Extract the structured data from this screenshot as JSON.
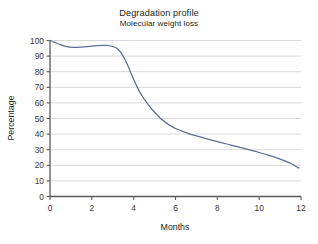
{
  "chart_data": {
    "type": "line",
    "title": "Degradation profile",
    "subtitle": "Molecular weight loss",
    "xlabel": "Months",
    "ylabel": "Percentage",
    "xlim": [
      0,
      12
    ],
    "ylim": [
      0,
      100
    ],
    "xticks": [
      0,
      2,
      4,
      6,
      8,
      10,
      12
    ],
    "yticks": [
      0,
      10,
      20,
      30,
      40,
      50,
      60,
      70,
      80,
      90,
      100
    ],
    "grid": "horizontal",
    "legend": "none",
    "line_color": "#5c6c94",
    "grid_color": "#d9d9d9",
    "axis_color": "#58595b",
    "series": [
      {
        "name": "Molecular weight loss",
        "x": [
          0,
          0.25,
          0.5,
          0.75,
          1.0,
          1.25,
          1.5,
          1.75,
          2.0,
          2.25,
          2.5,
          2.75,
          3.0,
          3.25,
          3.5,
          3.75,
          4.0,
          4.25,
          4.5,
          4.75,
          5.0,
          5.25,
          5.5,
          5.75,
          6.0,
          6.5,
          7.0,
          7.5,
          8.0,
          8.5,
          9.0,
          9.5,
          10.0,
          10.5,
          11.0,
          11.5,
          11.9
        ],
        "y": [
          100,
          98.6,
          97.3,
          96.3,
          95.8,
          95.6,
          95.7,
          96.0,
          96.4,
          96.7,
          96.9,
          96.8,
          96.2,
          94.4,
          90.0,
          83.0,
          75.0,
          68.0,
          62.5,
          58.0,
          54.0,
          50.5,
          47.8,
          45.5,
          43.6,
          41.0,
          38.8,
          36.9,
          35.2,
          33.5,
          31.8,
          30.0,
          28.2,
          26.2,
          24.0,
          21.3,
          18.2
        ]
      }
    ]
  }
}
